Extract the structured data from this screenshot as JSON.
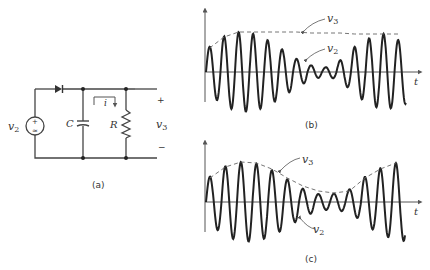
{
  "circuit": {
    "caption": "(a)",
    "source_label": "v",
    "source_sub": "2",
    "source_plus": "+",
    "source_minus": "−",
    "capacitor_label": "C",
    "resistor_label": "R",
    "current_label": "i",
    "output_label": "v",
    "output_sub": "3",
    "output_plus": "+",
    "output_minus": "−"
  },
  "panel_b": {
    "caption": "(b)",
    "envelope_label": "v",
    "envelope_sub": "3",
    "signal_label": "v",
    "signal_sub": "2",
    "time_label": "t"
  },
  "panel_c": {
    "caption": "(c)",
    "envelope_label": "v",
    "envelope_sub": "3",
    "signal_label": "v",
    "signal_sub": "2",
    "time_label": "t"
  },
  "chart_data": [
    {
      "type": "line",
      "title": "(b)",
      "xlabel": "t",
      "ylabel": "",
      "series": [
        {
          "name": "v2 (AM signal) peak amplitudes",
          "values": [
            24,
            35,
            40,
            39,
            33,
            24,
            14,
            7,
            4,
            10,
            24,
            33,
            39,
            32
          ]
        },
        {
          "name": "v3 (envelope, large RC)",
          "values": [
            24,
            35,
            40,
            40,
            40,
            40,
            40,
            39,
            39,
            39,
            38,
            38,
            38,
            38
          ]
        }
      ]
    },
    {
      "type": "line",
      "title": "(c)",
      "xlabel": "t",
      "ylabel": "",
      "series": [
        {
          "name": "v2 (AM signal) peak amplitudes",
          "values": [
            24,
            35,
            40,
            39,
            33,
            24,
            14,
            8,
            8,
            11,
            24,
            33,
            39
          ]
        },
        {
          "name": "v3 (envelope, proper RC)",
          "values": [
            24,
            35,
            40,
            39,
            33,
            24,
            16,
            11,
            9,
            11,
            24,
            33,
            39
          ]
        }
      ]
    }
  ]
}
